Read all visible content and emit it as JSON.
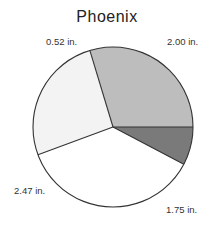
{
  "chart_data": {
    "type": "pie",
    "title": "Phoenix",
    "unit": "in.",
    "categories": [
      "Slice A",
      "Slice B",
      "Slice C",
      "Slice D"
    ],
    "values": [
      2.0,
      1.75,
      2.47,
      0.52
    ],
    "labels": [
      "2.00 in.",
      "1.75 in.",
      "2.47 in.",
      "0.52 in."
    ],
    "colors": [
      "#bdbdbd",
      "#f3f3f3",
      "#ffffff",
      "#7a7a7a"
    ],
    "start_angle_deg": 0,
    "direction": "counterclockwise",
    "legend": "none",
    "xlabel": "",
    "ylabel": ""
  }
}
